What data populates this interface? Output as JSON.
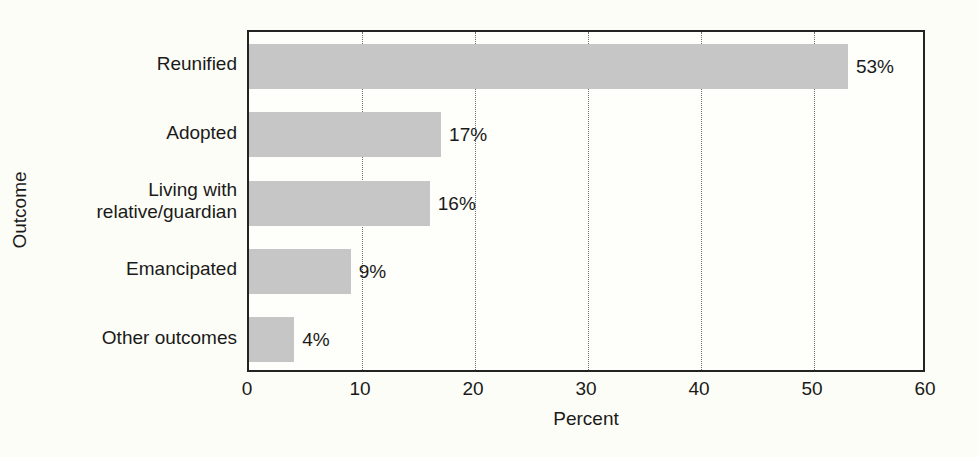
{
  "chart_data": {
    "type": "bar",
    "orientation": "horizontal",
    "title": "",
    "xlabel": "Percent",
    "ylabel": "Outcome",
    "categories": [
      "Reunified",
      "Adopted",
      "Living with\nrelative/guardian",
      "Emancipated",
      "Other outcomes"
    ],
    "values": [
      53,
      17,
      16,
      9,
      4
    ],
    "data_labels": [
      "53%",
      "17%",
      "16%",
      "9%",
      "4%"
    ],
    "xlim": [
      0,
      60
    ],
    "xticks": [
      0,
      10,
      20,
      30,
      40,
      50,
      60
    ],
    "xtick_labels": [
      "0",
      "10",
      "20",
      "30",
      "40",
      "50",
      "60"
    ],
    "grid": "vertical-dotted",
    "legend": "none",
    "colors": {
      "bar_fill": "#c6c6c6",
      "frame": "#232323",
      "gridline": "#6f6f6f",
      "text": "#1a1a1a",
      "background": "#fdfdf7"
    }
  },
  "axes": {
    "y_title": "Outcome",
    "x_title": "Percent"
  }
}
